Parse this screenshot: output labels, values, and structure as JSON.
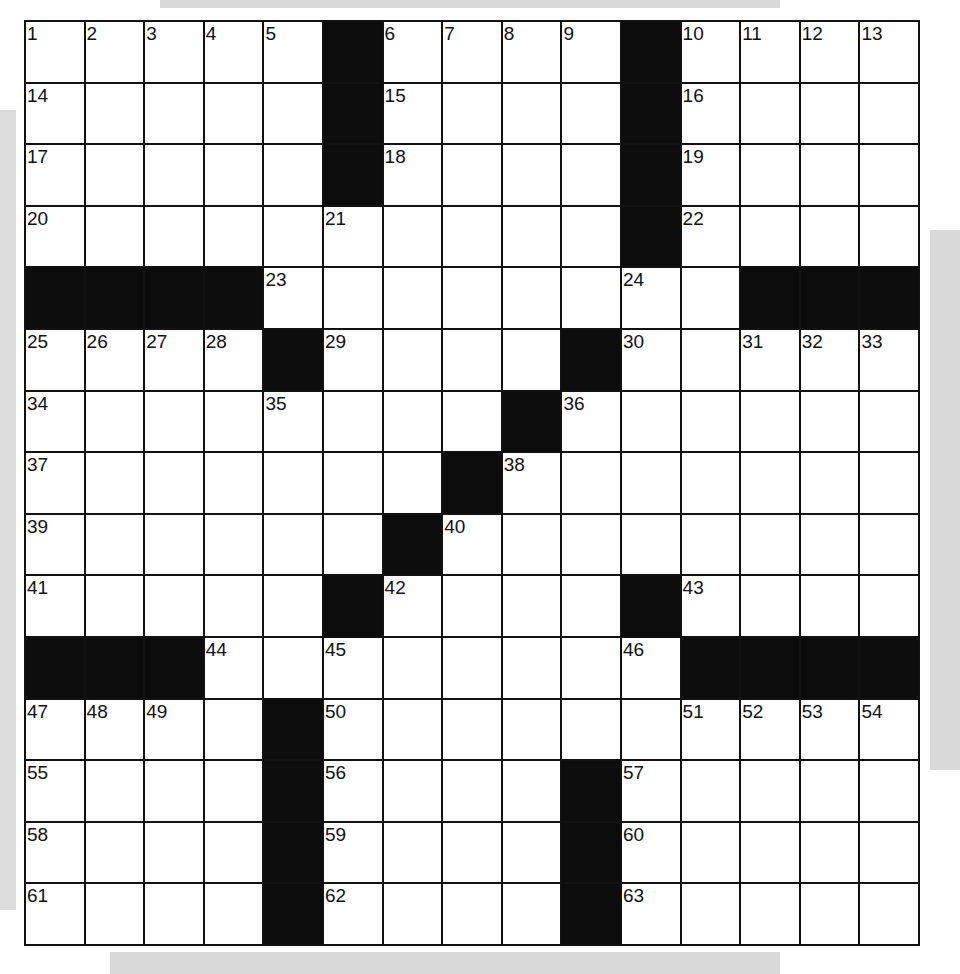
{
  "puzzle": {
    "rows": 15,
    "cols": 15,
    "colors": {
      "block": "#0c0c0c",
      "cell": "#ffffff",
      "line": "#111111"
    },
    "grid": [
      "....#....#....",
      "....#....#....",
      "....#....#....",
      "..........#....",
      "####........###",
      "....#....#.....",
      "........#......",
      ".......#.......",
      "......#........",
      ".....#....#....",
      "###........####",
      "....#..........",
      "....#....#.....",
      "....#....#.....",
      "....#....#....."
    ],
    "blocks": [
      [
        0,
        5
      ],
      [
        0,
        10
      ],
      [
        1,
        5
      ],
      [
        1,
        10
      ],
      [
        2,
        5
      ],
      [
        2,
        10
      ],
      [
        3,
        10
      ],
      [
        4,
        0
      ],
      [
        4,
        1
      ],
      [
        4,
        2
      ],
      [
        4,
        3
      ],
      [
        4,
        12
      ],
      [
        4,
        13
      ],
      [
        4,
        14
      ],
      [
        5,
        4
      ],
      [
        5,
        9
      ],
      [
        6,
        8
      ],
      [
        7,
        7
      ],
      [
        8,
        6
      ],
      [
        9,
        5
      ],
      [
        9,
        10
      ],
      [
        10,
        0
      ],
      [
        10,
        1
      ],
      [
        10,
        2
      ],
      [
        10,
        11
      ],
      [
        10,
        12
      ],
      [
        10,
        13
      ],
      [
        10,
        14
      ],
      [
        11,
        4
      ],
      [
        12,
        4
      ],
      [
        12,
        9
      ],
      [
        13,
        4
      ],
      [
        13,
        9
      ],
      [
        14,
        4
      ],
      [
        14,
        9
      ]
    ],
    "numbers": [
      {
        "r": 0,
        "c": 0,
        "n": "1"
      },
      {
        "r": 0,
        "c": 1,
        "n": "2"
      },
      {
        "r": 0,
        "c": 2,
        "n": "3"
      },
      {
        "r": 0,
        "c": 3,
        "n": "4"
      },
      {
        "r": 0,
        "c": 4,
        "n": "5"
      },
      {
        "r": 0,
        "c": 6,
        "n": "6"
      },
      {
        "r": 0,
        "c": 7,
        "n": "7"
      },
      {
        "r": 0,
        "c": 8,
        "n": "8"
      },
      {
        "r": 0,
        "c": 9,
        "n": "9"
      },
      {
        "r": 0,
        "c": 11,
        "n": "10"
      },
      {
        "r": 0,
        "c": 12,
        "n": "11"
      },
      {
        "r": 0,
        "c": 13,
        "n": "12"
      },
      {
        "r": 0,
        "c": 14,
        "n": "13"
      },
      {
        "r": 1,
        "c": 0,
        "n": "14"
      },
      {
        "r": 1,
        "c": 6,
        "n": "15"
      },
      {
        "r": 1,
        "c": 11,
        "n": "16"
      },
      {
        "r": 2,
        "c": 0,
        "n": "17"
      },
      {
        "r": 2,
        "c": 6,
        "n": "18"
      },
      {
        "r": 2,
        "c": 11,
        "n": "19"
      },
      {
        "r": 3,
        "c": 0,
        "n": "20"
      },
      {
        "r": 3,
        "c": 5,
        "n": "21"
      },
      {
        "r": 3,
        "c": 11,
        "n": "22"
      },
      {
        "r": 4,
        "c": 4,
        "n": "23"
      },
      {
        "r": 4,
        "c": 10,
        "n": "24"
      },
      {
        "r": 5,
        "c": 0,
        "n": "25"
      },
      {
        "r": 5,
        "c": 1,
        "n": "26"
      },
      {
        "r": 5,
        "c": 2,
        "n": "27"
      },
      {
        "r": 5,
        "c": 3,
        "n": "28"
      },
      {
        "r": 5,
        "c": 5,
        "n": "29"
      },
      {
        "r": 5,
        "c": 10,
        "n": "30"
      },
      {
        "r": 5,
        "c": 12,
        "n": "31"
      },
      {
        "r": 5,
        "c": 13,
        "n": "32"
      },
      {
        "r": 5,
        "c": 14,
        "n": "33"
      },
      {
        "r": 6,
        "c": 0,
        "n": "34"
      },
      {
        "r": 6,
        "c": 4,
        "n": "35"
      },
      {
        "r": 6,
        "c": 9,
        "n": "36"
      },
      {
        "r": 7,
        "c": 0,
        "n": "37"
      },
      {
        "r": 7,
        "c": 8,
        "n": "38"
      },
      {
        "r": 8,
        "c": 0,
        "n": "39"
      },
      {
        "r": 8,
        "c": 7,
        "n": "40"
      },
      {
        "r": 9,
        "c": 0,
        "n": "41"
      },
      {
        "r": 9,
        "c": 6,
        "n": "42"
      },
      {
        "r": 9,
        "c": 11,
        "n": "43"
      },
      {
        "r": 10,
        "c": 3,
        "n": "44"
      },
      {
        "r": 10,
        "c": 5,
        "n": "45"
      },
      {
        "r": 10,
        "c": 10,
        "n": "46"
      },
      {
        "r": 11,
        "c": 0,
        "n": "47"
      },
      {
        "r": 11,
        "c": 1,
        "n": "48"
      },
      {
        "r": 11,
        "c": 2,
        "n": "49"
      },
      {
        "r": 11,
        "c": 5,
        "n": "50"
      },
      {
        "r": 11,
        "c": 11,
        "n": "51"
      },
      {
        "r": 11,
        "c": 12,
        "n": "52"
      },
      {
        "r": 11,
        "c": 13,
        "n": "53"
      },
      {
        "r": 11,
        "c": 14,
        "n": "54"
      },
      {
        "r": 12,
        "c": 0,
        "n": "55"
      },
      {
        "r": 12,
        "c": 5,
        "n": "56"
      },
      {
        "r": 12,
        "c": 10,
        "n": "57"
      },
      {
        "r": 13,
        "c": 0,
        "n": "58"
      },
      {
        "r": 13,
        "c": 5,
        "n": "59"
      },
      {
        "r": 13,
        "c": 10,
        "n": "60"
      },
      {
        "r": 14,
        "c": 0,
        "n": "61"
      },
      {
        "r": 14,
        "c": 5,
        "n": "62"
      },
      {
        "r": 14,
        "c": 10,
        "n": "63"
      }
    ]
  }
}
